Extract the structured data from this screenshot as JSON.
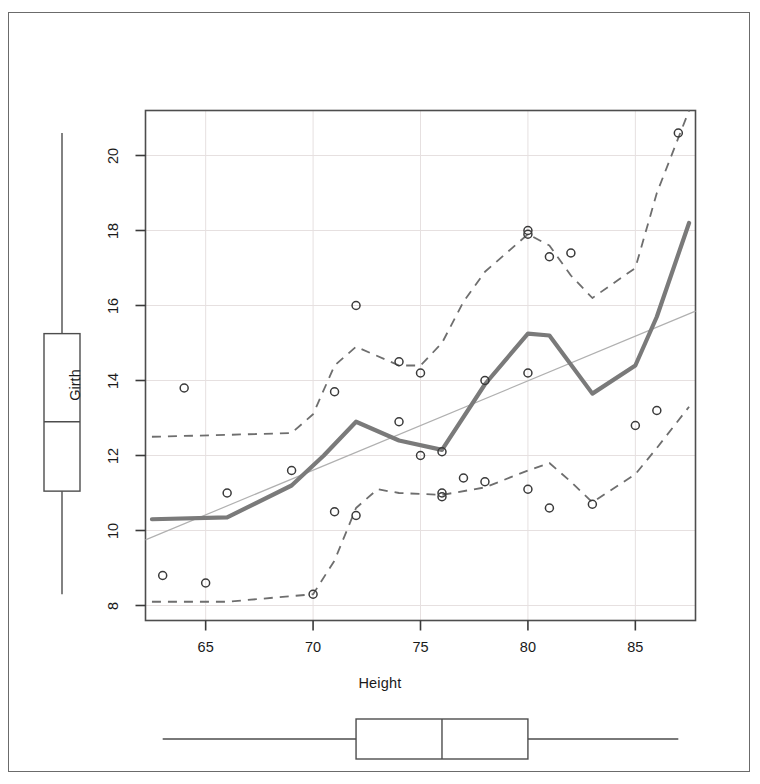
{
  "figure": {
    "background": "#ffffff",
    "frame_color": "#6b6b6b",
    "panel_border_color": "#4d4d4d",
    "grid_color": "#e6e0e0",
    "point_color": "#3a3a3a",
    "loess_color": "#7a7a7a",
    "band_color": "#6e6e6e",
    "regline_color": "#b0b0b0",
    "box_color": "#4d4d4d"
  },
  "axes": {
    "x_title": "Height",
    "y_title": "Girth",
    "x_ticks": [
      65,
      70,
      75,
      80,
      85
    ],
    "y_ticks": [
      8,
      10,
      12,
      14,
      16,
      18,
      20
    ],
    "xlim": [
      62.2,
      87.8
    ],
    "ylim": [
      7.6,
      21.2
    ],
    "grid": true
  },
  "chart_data": {
    "type": "scatter",
    "title": "",
    "xlabel": "Height",
    "ylabel": "Girth",
    "xlim": [
      62.2,
      87.8
    ],
    "ylim": [
      7.6,
      21.2
    ],
    "x_ticks": [
      65,
      70,
      75,
      80,
      85
    ],
    "y_ticks": [
      8,
      10,
      12,
      14,
      16,
      18,
      20
    ],
    "grid": true,
    "legend": null,
    "points": {
      "x": [
        63,
        64,
        65,
        66,
        69,
        70,
        71,
        71,
        72,
        72,
        74,
        74,
        75,
        75,
        76,
        76,
        76,
        77,
        78,
        78,
        80,
        80,
        80,
        80,
        81,
        81,
        82,
        83,
        85,
        86,
        87
      ],
      "y": [
        8.8,
        13.8,
        8.6,
        11.0,
        11.6,
        8.3,
        10.5,
        13.7,
        10.4,
        16.0,
        12.9,
        14.5,
        14.2,
        12.0,
        11.0,
        10.9,
        12.1,
        11.4,
        11.3,
        14.0,
        11.1,
        14.2,
        17.9,
        18.0,
        10.6,
        17.3,
        17.4,
        10.7,
        12.8,
        13.2,
        20.6
      ]
    },
    "series": [
      {
        "name": "loess-smooth",
        "type": "line",
        "style": "solid-thick",
        "color": "#7a7a7a",
        "x": [
          62.5,
          66.0,
          69.0,
          70.5,
          72.0,
          74.0,
          76.0,
          78.0,
          80.0,
          81.0,
          83.0,
          85.0,
          86.0,
          87.5
        ],
        "y": [
          10.3,
          10.35,
          11.2,
          12.0,
          12.9,
          12.4,
          12.15,
          13.9,
          15.25,
          15.2,
          13.65,
          14.4,
          15.7,
          18.2
        ]
      },
      {
        "name": "upper-band",
        "type": "line",
        "style": "dashed",
        "color": "#6e6e6e",
        "x": [
          62.5,
          66.0,
          69.0,
          70.0,
          71.0,
          72.0,
          74.0,
          75.0,
          76.0,
          77.0,
          78.0,
          80.0,
          81.0,
          82.0,
          83.0,
          85.0,
          86.0,
          87.5
        ],
        "y": [
          12.5,
          12.55,
          12.6,
          13.1,
          14.4,
          14.9,
          14.4,
          14.4,
          15.0,
          16.1,
          16.9,
          17.9,
          17.6,
          16.8,
          16.2,
          17.0,
          19.0,
          21.2
        ]
      },
      {
        "name": "lower-band",
        "type": "line",
        "style": "dashed",
        "color": "#6e6e6e",
        "x": [
          62.5,
          66.0,
          69.0,
          70.0,
          71.0,
          72.0,
          73.0,
          74.0,
          76.0,
          78.0,
          80.0,
          81.0,
          82.0,
          83.0,
          85.0,
          86.0,
          87.5
        ],
        "y": [
          8.1,
          8.1,
          8.25,
          8.3,
          9.2,
          10.6,
          11.1,
          11.0,
          10.95,
          11.15,
          11.6,
          11.8,
          11.3,
          10.75,
          11.5,
          12.2,
          13.3
        ]
      },
      {
        "name": "linear-fit",
        "type": "line",
        "style": "thin",
        "color": "#b0b0b0",
        "x": [
          62.2,
          87.8
        ],
        "y": [
          9.75,
          15.85
        ]
      }
    ],
    "marginal_boxplots": [
      {
        "name": "girth-boxplot",
        "orientation": "vertical",
        "variable": "Girth",
        "label": "Girth",
        "min": 8.3,
        "q1": 11.05,
        "median": 12.9,
        "q3": 15.25,
        "max": 20.6
      },
      {
        "name": "height-boxplot",
        "orientation": "horizontal",
        "variable": "Height",
        "label": "",
        "min": 63,
        "q1": 72,
        "median": 76,
        "q3": 80,
        "max": 87
      }
    ]
  }
}
